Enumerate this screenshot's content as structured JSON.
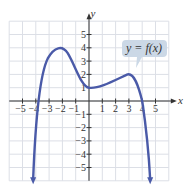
{
  "chart_data": {
    "type": "line",
    "title": "",
    "xlabel": "x",
    "ylabel": "y",
    "xlim": [
      -6,
      6
    ],
    "ylim": [
      -6,
      6
    ],
    "grid": true,
    "x_ticks": [
      -5,
      -4,
      -3,
      -2,
      -1,
      1,
      2,
      3,
      4,
      5
    ],
    "y_ticks": [
      5,
      4,
      3,
      2,
      1,
      -1,
      -2,
      -3,
      -4,
      -5
    ],
    "x_tick_labels": [
      "−5",
      "−4",
      "−3",
      "−2",
      "−1",
      "1",
      "2",
      "3",
      "4",
      "5"
    ],
    "y_tick_labels": [
      "5",
      "4",
      "3",
      "2",
      "1",
      "−1",
      "−2",
      "−3",
      "−4",
      "−5"
    ],
    "series": [
      {
        "name": "y = f(x)",
        "color": "#4a5aa8",
        "points": [
          {
            "x": -4.4,
            "y": -6
          },
          {
            "x": -4,
            "y": 0
          },
          {
            "x": -2,
            "y": 4
          },
          {
            "x": 0,
            "y": 1
          },
          {
            "x": 3,
            "y": 2
          },
          {
            "x": 4,
            "y": 0
          },
          {
            "x": 4.5,
            "y": -6
          }
        ],
        "end_behavior": "arrows pointing down at both ends"
      }
    ],
    "annotations": [
      {
        "text": "y = f(x)",
        "type": "callout",
        "points_to": {
          "x": 3.5,
          "y": 2.4
        }
      }
    ]
  },
  "labels": {
    "x_axis": "x",
    "y_axis": "y",
    "callout": "y = f(x)"
  },
  "colors": {
    "curve": "#4a5aa8",
    "grid": "#dcdfe6",
    "axis": "#333333",
    "callout_bg": "#cbd8e6"
  }
}
